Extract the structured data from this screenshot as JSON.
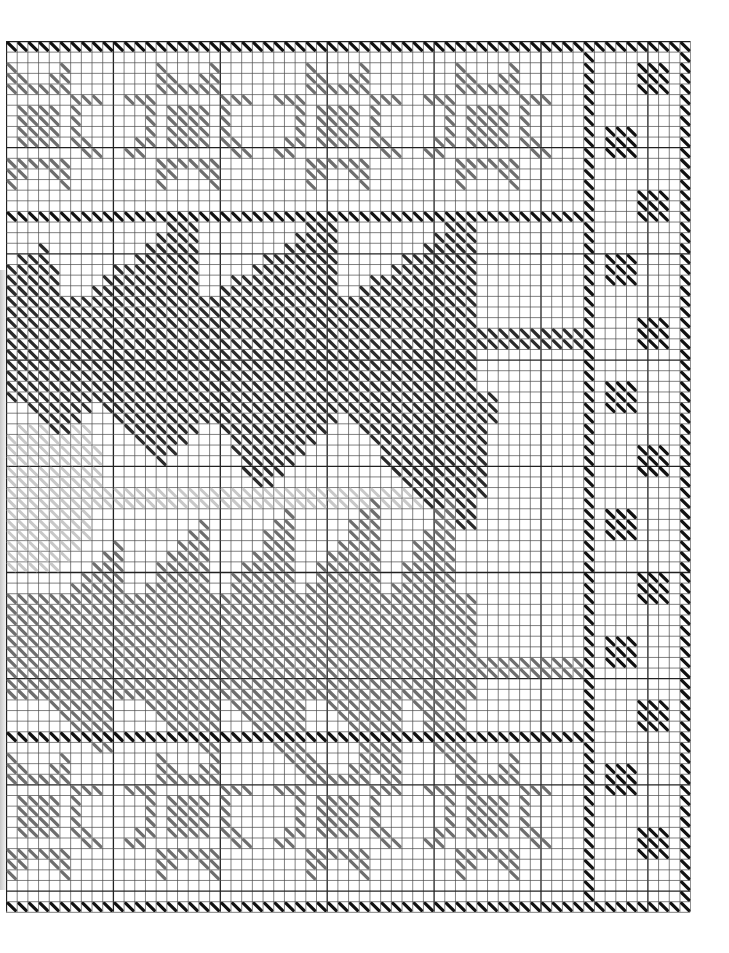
{
  "chart": {
    "cols": 64,
    "rows": 82,
    "cell_w": 10.69,
    "cell_h": 10.62,
    "bold_every": 10,
    "colors": {
      "grid": "#4a4a4a",
      "grid_bold": "#222222",
      "black": "#111111",
      "dark": "#2a2a2a",
      "mid": "#6e6e6e",
      "light": "#c8c8c8"
    }
  },
  "elements": {
    "borders": [
      {
        "name": "top-border",
        "color": "black",
        "rect": [
          0,
          0,
          63,
          0
        ]
      },
      {
        "name": "bottom-border",
        "color": "black",
        "rect": [
          0,
          81,
          63,
          81
        ]
      },
      {
        "name": "right-outer-border",
        "color": "black",
        "rect": [
          63,
          0,
          63,
          81
        ]
      },
      {
        "name": "inner-vertical-border",
        "color": "black",
        "rect": [
          54,
          0,
          54,
          81
        ]
      },
      {
        "name": "top-divider",
        "color": "black",
        "rect": [
          0,
          16,
          53,
          16
        ]
      },
      {
        "name": "bottom-divider",
        "color": "black",
        "rect": [
          0,
          65,
          53,
          65
        ]
      }
    ],
    "star_motif": {
      "color": "mid",
      "cells": [
        [
          3,
          0
        ],
        [
          8,
          0
        ],
        [
          3,
          1
        ],
        [
          4,
          1
        ],
        [
          7,
          1
        ],
        [
          8,
          1
        ],
        [
          3,
          2
        ],
        [
          4,
          2
        ],
        [
          5,
          2
        ],
        [
          6,
          2
        ],
        [
          7,
          2
        ],
        [
          8,
          2
        ],
        [
          0,
          3
        ],
        [
          1,
          3
        ],
        [
          2,
          3
        ],
        [
          9,
          3
        ],
        [
          10,
          3
        ],
        [
          11,
          3
        ],
        [
          2,
          4
        ],
        [
          9,
          4
        ],
        [
          2,
          5
        ],
        [
          9,
          5
        ],
        [
          2,
          6
        ],
        [
          9,
          6
        ],
        [
          1,
          7
        ],
        [
          2,
          7
        ],
        [
          9,
          7
        ],
        [
          10,
          7
        ],
        [
          0,
          8
        ],
        [
          1,
          8
        ],
        [
          10,
          8
        ],
        [
          11,
          8
        ],
        [
          3,
          9
        ],
        [
          4,
          9
        ],
        [
          5,
          9
        ],
        [
          6,
          9
        ],
        [
          7,
          9
        ],
        [
          8,
          9
        ],
        [
          3,
          10
        ],
        [
          4,
          10
        ],
        [
          7,
          10
        ],
        [
          8,
          10
        ],
        [
          3,
          11
        ],
        [
          8,
          11
        ],
        [
          4,
          4
        ],
        [
          5,
          4
        ],
        [
          6,
          4
        ],
        [
          7,
          4
        ],
        [
          4,
          5
        ],
        [
          5,
          5
        ],
        [
          6,
          5
        ],
        [
          7,
          5
        ],
        [
          4,
          6
        ],
        [
          5,
          6
        ],
        [
          6,
          6
        ],
        [
          7,
          6
        ],
        [
          4,
          7
        ],
        [
          5,
          7
        ],
        [
          6,
          7
        ],
        [
          7,
          7
        ]
      ],
      "col_offsets": [
        -3,
        11,
        25,
        39
      ],
      "row_offsets": [
        2,
        67
      ]
    },
    "side_blocks": {
      "color": "black",
      "size": 3,
      "left_col": 56,
      "right_col": 59,
      "start_row": 2,
      "period": 6,
      "pattern": [
        "right",
        "left"
      ]
    },
    "fish": [
      {
        "name": "dark-fish",
        "color": "dark",
        "polygons": [
          [
            [
              0,
              21
            ],
            [
              3.5,
              19
            ],
            [
              5,
              22
            ],
            [
              5,
              24
            ],
            [
              0,
              24
            ]
          ],
          [
            [
              0,
              24
            ],
            [
              44,
              24
            ],
            [
              44,
              34
            ],
            [
              0,
              34
            ]
          ],
          [
            [
              6,
              25
            ],
            [
              16,
              17
            ],
            [
              18,
              17
            ],
            [
              18,
              25
            ]
          ],
          [
            [
              18,
              25
            ],
            [
              29,
              17
            ],
            [
              31,
              17
            ],
            [
              31,
              25
            ]
          ],
          [
            [
              31,
              25
            ],
            [
              42,
              17
            ],
            [
              44,
              17
            ],
            [
              44,
              25
            ]
          ],
          [
            [
              0,
              33
            ],
            [
              10,
              33
            ],
            [
              5,
              37
            ]
          ],
          [
            [
              7,
              33
            ],
            [
              22,
              33
            ],
            [
              15,
              40
            ]
          ],
          [
            [
              18,
              33
            ],
            [
              33,
              33
            ],
            [
              24,
              43
            ]
          ],
          [
            [
              30,
              33
            ],
            [
              46,
              33
            ],
            [
              44,
              46
            ],
            [
              41,
              46
            ]
          ]
        ],
        "line": {
          "color": "dark",
          "rect": [
            44,
            27,
            53,
            28
          ]
        }
      },
      {
        "name": "light-fish",
        "color": "light",
        "polygons": [
          [
            [
              0,
              37
            ],
            [
              4,
              35
            ],
            [
              8,
              36
            ],
            [
              9,
              40
            ],
            [
              8,
              47
            ],
            [
              4,
              50
            ],
            [
              0,
              50
            ]
          ]
        ],
        "line": {
          "color": "light",
          "rect": [
            0,
            42,
            39,
            43
          ]
        }
      },
      {
        "name": "gray-fish",
        "color": "mid",
        "polygons": [
          [
            [
              0,
              52
            ],
            [
              44,
              52
            ],
            [
              44,
              62
            ],
            [
              0,
              62
            ]
          ],
          [
            [
              3,
              55
            ],
            [
              10,
              47
            ],
            [
              11,
              47
            ],
            [
              11,
              55
            ]
          ],
          [
            [
              11,
              54
            ],
            [
              18,
              45
            ],
            [
              19,
              45
            ],
            [
              19,
              54
            ]
          ],
          [
            [
              19,
              54
            ],
            [
              26,
              44
            ],
            [
              27,
              44
            ],
            [
              27,
              54
            ]
          ],
          [
            [
              27,
              53
            ],
            [
              34,
              43
            ],
            [
              35,
              43
            ],
            [
              35,
              53
            ]
          ],
          [
            [
              35,
              53
            ],
            [
              40,
              45
            ],
            [
              42,
              43
            ],
            [
              42,
              53
            ]
          ],
          [
            [
              4,
              62
            ],
            [
              10,
              62
            ],
            [
              10,
              67
            ],
            [
              9,
              67
            ]
          ],
          [
            [
              12,
              62
            ],
            [
              20,
              62
            ],
            [
              20,
              67
            ],
            [
              19,
              67
            ]
          ],
          [
            [
              21,
              62
            ],
            [
              28,
              62
            ],
            [
              28,
              69
            ],
            [
              27,
              69
            ]
          ],
          [
            [
              30,
              62
            ],
            [
              37,
              62
            ],
            [
              37,
              71
            ],
            [
              36,
              71
            ]
          ],
          [
            [
              38,
              62
            ],
            [
              43,
              62
            ],
            [
              44,
              71
            ],
            [
              43,
              71
            ]
          ]
        ],
        "line": {
          "color": "mid",
          "rect": [
            44,
            58,
            53,
            59
          ]
        }
      }
    ]
  }
}
